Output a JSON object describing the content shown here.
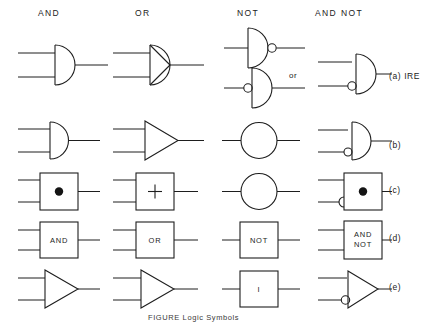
{
  "figure": {
    "caption": "FIGURE   Logic Symbols",
    "column_headers": [
      {
        "id": "and",
        "label": "AND",
        "x": 52,
        "y": 14
      },
      {
        "id": "or",
        "label": "OR",
        "x": 146,
        "y": 14
      },
      {
        "id": "not",
        "label": "NOT",
        "x": 245,
        "y": 14
      },
      {
        "id": "and-not",
        "label": "AND NOT",
        "x": 327,
        "y": 14
      }
    ],
    "row_labels": [
      {
        "id": "a",
        "label": "(a) IRE",
        "x": 392,
        "y": 77
      },
      {
        "id": "b",
        "label": "(b)",
        "x": 392,
        "y": 146
      },
      {
        "id": "c",
        "label": "(c)",
        "x": 392,
        "y": 191
      },
      {
        "id": "d",
        "label": "(d)",
        "x": 392,
        "y": 239
      },
      {
        "id": "e",
        "label": "(e)",
        "x": 392,
        "y": 288
      }
    ],
    "annotations": [
      {
        "id": "or-alternative",
        "label": "or",
        "x": 293,
        "y": 76
      }
    ],
    "box_texts": {
      "and_box_d": "AND",
      "or_box_d": "OR",
      "not_box_d": "NOT",
      "and_not_box_d_line1": "AND",
      "and_not_box_d_line2": "NOT",
      "not_box_e": "I"
    },
    "colors": {
      "ink": "#1e1e1e",
      "background": "#ffffff"
    },
    "symbol_sets": [
      {
        "row": "a",
        "standard": "IRE",
        "and": "d-shape-semicircle",
        "or": "d-shape-with-diagonal",
        "not": "d-shape-with-output-bubble, alternate d-shape-with-input-bubble",
        "and_not": "d-shape-with-lower-input-bubble"
      },
      {
        "row": "b",
        "and": "d-shape-semicircle",
        "or": "triangle",
        "not": "circle",
        "and_not": "d-shape-with-lower-input-bubble"
      },
      {
        "row": "c",
        "and": "square-with-dot",
        "or": "square-with-plus",
        "not": "circle",
        "and_not": "square-with-dot-and-lower-input-bubble"
      },
      {
        "row": "d",
        "and": "box-labeled-AND",
        "or": "box-labeled-OR",
        "not": "box-labeled-NOT",
        "and_not": "box-labeled-AND-NOT"
      },
      {
        "row": "e",
        "and": "triangle",
        "or": "triangle",
        "not": "box-labeled-I",
        "and_not": "triangle-with-lower-input-bubble"
      }
    ]
  }
}
